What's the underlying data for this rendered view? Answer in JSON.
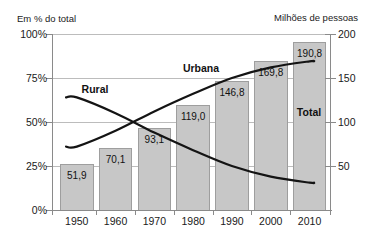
{
  "chart_data": {
    "type": "combo-bar-line",
    "categories": [
      "1950",
      "1960",
      "1970",
      "1980",
      "1990",
      "2000",
      "2010"
    ],
    "bar_series": {
      "name": "Total",
      "axis": "right",
      "values": [
        51.9,
        70.1,
        93.1,
        119.0,
        146.8,
        169.8,
        190.8
      ],
      "labels": [
        "51,9",
        "70,1",
        "93,1",
        "119,0",
        "146,8",
        "169,8",
        "190,8"
      ]
    },
    "line_series": [
      {
        "name": "Urbana",
        "axis": "left",
        "values": [
          36,
          45,
          56,
          66,
          75,
          81,
          84.5
        ]
      },
      {
        "name": "Rural",
        "axis": "left",
        "values": [
          64,
          55,
          44,
          34,
          25,
          19,
          15.5
        ]
      }
    ],
    "left_axis": {
      "title": "Em % do total",
      "ticks": [
        "100%",
        "75%",
        "50%",
        "25%",
        "0%"
      ],
      "range": [
        0,
        100
      ]
    },
    "right_axis": {
      "title": "Milhões de pessoas",
      "ticks": [
        "200",
        "150",
        "100",
        "50"
      ],
      "range": [
        0,
        200
      ]
    },
    "annotations": {
      "bar": "Total",
      "line_up": "Urbana",
      "line_down": "Rural"
    },
    "grid": "horizontal",
    "legend_position": "inline-labels",
    "colors": {
      "bar_fill": "#c7c7c7",
      "bar_border": "#9e9e9e",
      "line": "#141414",
      "grid": "#bcbcbc",
      "axis": "#8a8a8a",
      "text": "#1a1a1a",
      "background": "#ffffff"
    }
  }
}
